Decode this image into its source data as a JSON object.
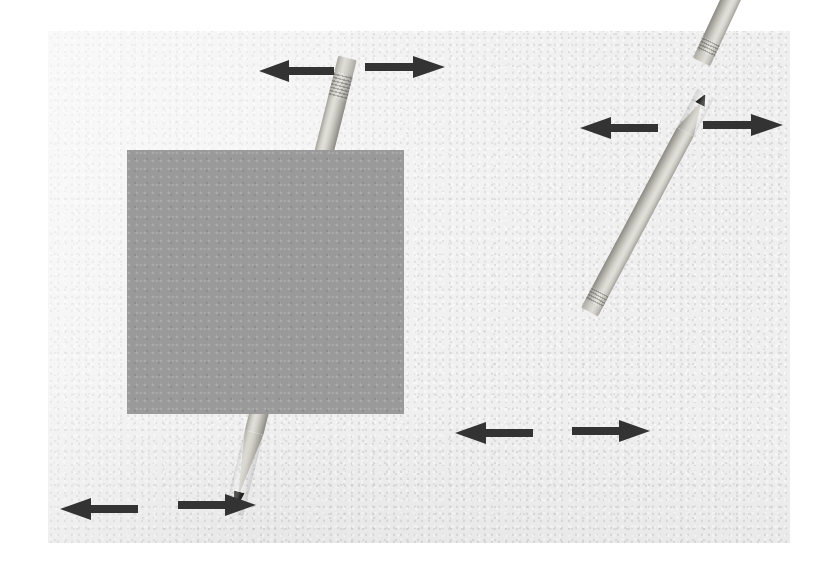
{
  "figure": {
    "background_color": "#ffffff",
    "paper_color": "#efefef",
    "occluder_color": "#9a9a9a",
    "arrow_color": "#333333",
    "pencil_body_color": "#d2d0c9",
    "pencil_lead_color": "#1d1d1c",
    "canvas": {
      "width": 833,
      "height": 568
    },
    "paper_panel": {
      "x": 48,
      "y": 31,
      "width": 742,
      "height": 512
    }
  },
  "occluders": [
    {
      "name": "grey-rectangle",
      "label": "Occluding rectangle",
      "x": 127,
      "y": 150,
      "width": 277,
      "height": 264,
      "color": "#9a9a9a"
    }
  ],
  "pencils": [
    {
      "name": "pencil-top-left",
      "label": "Pencil 1 (occluded by rectangle)",
      "eraser_end": "top",
      "tip_end": "bottom",
      "angle_deg": 14,
      "length": 470,
      "width": 19,
      "origin": {
        "x": 347,
        "y": 58
      },
      "occluded": true
    },
    {
      "name": "pencil-right-upper",
      "label": "Pencil 2 (unoccluded, upper right)",
      "eraser_end": "top",
      "tip_end": "bottom",
      "angle_deg": 205,
      "length": 246,
      "width": 19,
      "origin": {
        "x": 701,
        "y": 62
      },
      "occluded": false
    },
    {
      "name": "pencil-right-lower",
      "label": "Pencil 3 (unoccluded, lower right)",
      "eraser_end": "top",
      "tip_end": "bottom",
      "angle_deg": 208,
      "length": 248,
      "width": 19,
      "origin": {
        "x": 589,
        "y": 312
      },
      "occluded": false
    }
  ],
  "arrow_pairs": [
    {
      "name": "arrow-pair-top",
      "label": "Bidirectional arrows above pencil 1",
      "left_arrow": {
        "name": "arrow-left-top",
        "direction": "left",
        "x": 259,
        "y": 58,
        "width": 75,
        "height": 26
      },
      "right_arrow": {
        "name": "arrow-right-top",
        "direction": "right",
        "x": 365,
        "y": 54,
        "width": 80,
        "height": 26
      }
    },
    {
      "name": "arrow-pair-right-upper",
      "label": "Bidirectional arrows across pencil 2",
      "left_arrow": {
        "name": "arrow-left-right-upper",
        "direction": "left",
        "x": 580,
        "y": 115,
        "width": 78,
        "height": 26
      },
      "right_arrow": {
        "name": "arrow-right-right-upper",
        "direction": "right",
        "x": 703,
        "y": 112,
        "width": 80,
        "height": 26
      }
    },
    {
      "name": "arrow-pair-right-lower",
      "label": "Bidirectional arrows across pencil 3",
      "left_arrow": {
        "name": "arrow-left-right-lower",
        "direction": "left",
        "x": 455,
        "y": 420,
        "width": 78,
        "height": 26
      },
      "right_arrow": {
        "name": "arrow-right-right-lower",
        "direction": "right",
        "x": 572,
        "y": 418,
        "width": 78,
        "height": 26
      }
    },
    {
      "name": "arrow-pair-bottom-left",
      "label": "Bidirectional arrows beside pencil 1 tip",
      "left_arrow": {
        "name": "arrow-left-bottom",
        "direction": "left",
        "x": 60,
        "y": 496,
        "width": 78,
        "height": 26
      },
      "right_arrow": {
        "name": "arrow-right-bottom",
        "direction": "right",
        "x": 178,
        "y": 492,
        "width": 78,
        "height": 26
      }
    }
  ]
}
